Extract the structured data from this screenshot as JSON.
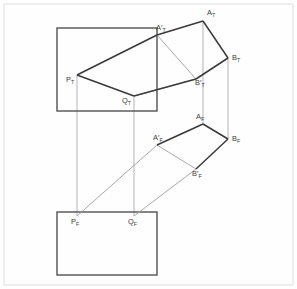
{
  "figure": {
    "width": 297,
    "height": 289,
    "colors": {
      "background": "#fefefe",
      "frame": "#d8d8d8",
      "plane_outline": "#4a4a4a",
      "solid_edge": "#3a3a3a",
      "light_edge": "#9a9a9a",
      "projector": "#a8a8a8",
      "label_text": "#3b3b3b"
    }
  },
  "frame": {
    "x": 4,
    "y": 4,
    "width": 289,
    "height": 281
  },
  "planes": [
    {
      "id": "top-plane-rect",
      "name": "top-view-plane",
      "x": 57,
      "y": 28,
      "width": 100,
      "height": 83
    },
    {
      "id": "front-plane-rect",
      "name": "front-view-plane",
      "x": 57,
      "y": 212,
      "width": 100,
      "height": 63
    }
  ],
  "points": [
    {
      "id": "A_T",
      "base": "A",
      "prime": false,
      "sub": "T",
      "label_x": 207,
      "label_y": 15,
      "vx": 203,
      "vy": 21
    },
    {
      "id": "Ap_T",
      "base": "A",
      "prime": true,
      "sub": "T",
      "label_x": 156,
      "label_y": 30,
      "vx": 157,
      "vy": 35
    },
    {
      "id": "B_T",
      "base": "B",
      "prime": false,
      "sub": "T",
      "label_x": 232,
      "label_y": 60,
      "vx": 228,
      "vy": 58
    },
    {
      "id": "Bp_T",
      "base": "B",
      "prime": true,
      "sub": "T",
      "label_x": 195,
      "label_y": 85,
      "vx": 196,
      "vy": 79
    },
    {
      "id": "P_T",
      "base": "P",
      "prime": false,
      "sub": "T",
      "label_x": 66,
      "label_y": 82,
      "vx": 77,
      "vy": 75
    },
    {
      "id": "Q_T",
      "base": "Q",
      "prime": false,
      "sub": "T",
      "label_x": 122,
      "label_y": 103,
      "vx": 134,
      "vy": 96
    },
    {
      "id": "A_F",
      "base": "A",
      "prime": false,
      "sub": "F",
      "label_x": 196,
      "label_y": 119,
      "vx": 203,
      "vy": 124
    },
    {
      "id": "Ap_F",
      "base": "A",
      "prime": true,
      "sub": "F",
      "label_x": 153,
      "label_y": 140,
      "vx": 157,
      "vy": 145
    },
    {
      "id": "B_F",
      "base": "B",
      "prime": false,
      "sub": "F",
      "label_x": 232,
      "label_y": 141,
      "vx": 228,
      "vy": 139
    },
    {
      "id": "Bp_F",
      "base": "B",
      "prime": true,
      "sub": "F",
      "label_x": 192,
      "label_y": 176,
      "vx": 196,
      "vy": 169
    },
    {
      "id": "P_F",
      "base": "P",
      "prime": false,
      "sub": "F",
      "label_x": 71,
      "label_y": 224,
      "vx": 77,
      "vy": 216
    },
    {
      "id": "Q_F",
      "base": "Q",
      "prime": false,
      "sub": "F",
      "label_x": 128,
      "label_y": 224,
      "vx": 134,
      "vy": 216
    }
  ],
  "edges": {
    "top_solid": "M 157,35 L 203,21 L 228,58 L 196,79 L 77,75 L 134,96 Z",
    "top_solid_segments": [
      {
        "name": "edge-ApT-AT",
        "d": "M 157,35 L 203,21"
      },
      {
        "name": "edge-AT-BT",
        "d": "M 203,21 L 228,58"
      },
      {
        "name": "edge-BT-BpT",
        "d": "M 228,58 L 196,79"
      },
      {
        "name": "edge-PT-QT",
        "d": "M 77,75 L 134,96"
      },
      {
        "name": "edge-AT-BpT",
        "d": "M 203,21 L 196,79"
      }
    ],
    "top_light_segments": [
      {
        "name": "edge-PT-ApT",
        "d": "M 77,75 L 157,35"
      },
      {
        "name": "edge-QT-BpT",
        "d": "M 134,96 L 196,79"
      }
    ],
    "front_solid_segments": [
      {
        "name": "edge-ApF-AF",
        "d": "M 157,145 L 203,124"
      },
      {
        "name": "edge-AF-BF",
        "d": "M 203,124 L 228,139"
      },
      {
        "name": "edge-BF-BpF",
        "d": "M 228,139 L 196,169"
      }
    ],
    "front_light_segments": [
      {
        "name": "edge-PF-ApF",
        "d": "M 77,216 L 157,145"
      },
      {
        "name": "edge-QF-BpF",
        "d": "M 134,216 L 196,169"
      }
    ]
  },
  "projectors": [
    {
      "name": "projector-PT-PF",
      "x1": 77,
      "y1": 75,
      "x2": 77,
      "y2": 216
    },
    {
      "name": "projector-QT-QF",
      "x1": 134,
      "y1": 96,
      "x2": 134,
      "y2": 216
    },
    {
      "name": "projector-AT-AF",
      "x1": 203,
      "y1": 21,
      "x2": 203,
      "y2": 124
    },
    {
      "name": "projector-BT-BF",
      "x1": 228,
      "y1": 58,
      "x2": 228,
      "y2": 139
    }
  ]
}
